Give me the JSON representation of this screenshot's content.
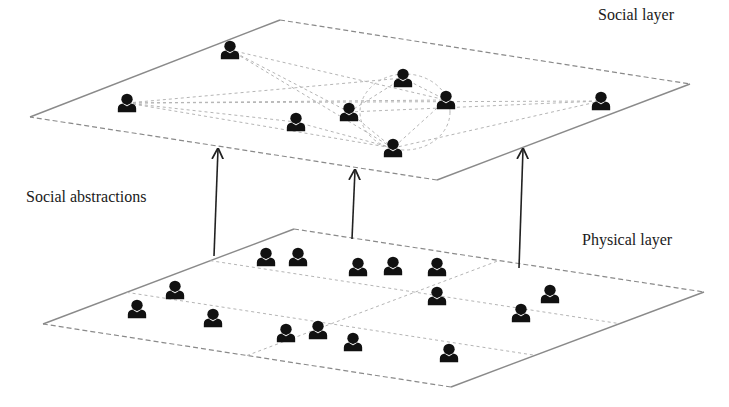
{
  "labels": {
    "social_layer": "Social layer",
    "physical_layer": "Physical layer",
    "social_abstractions": "Social abstractions"
  },
  "colors": {
    "plane_edge": "#8a8a8a",
    "dashed_link": "#b5b5b5",
    "person": "#111111",
    "arrow": "#222222"
  },
  "social_layer": {
    "plane": [
      [
        30,
        117
      ],
      [
        280,
        20
      ],
      [
        690,
        84
      ],
      [
        437,
        180
      ]
    ],
    "persons": [
      [
        230,
        50
      ],
      [
        127,
        103
      ],
      [
        296,
        122
      ],
      [
        349,
        112
      ],
      [
        403,
        78
      ],
      [
        446,
        100
      ],
      [
        393,
        148
      ],
      [
        601,
        101
      ]
    ],
    "links": [
      [
        0,
        5
      ],
      [
        0,
        6
      ],
      [
        0,
        3
      ],
      [
        1,
        4
      ],
      [
        1,
        5
      ],
      [
        1,
        7
      ],
      [
        1,
        2
      ],
      [
        1,
        6
      ],
      [
        2,
        6
      ],
      [
        3,
        6
      ],
      [
        3,
        4
      ],
      [
        4,
        5
      ],
      [
        5,
        6
      ],
      [
        6,
        7
      ],
      [
        3,
        7
      ]
    ]
  },
  "physical_layer": {
    "plane": [
      [
        43,
        324
      ],
      [
        294,
        229
      ],
      [
        704,
        292
      ],
      [
        451,
        387
      ]
    ],
    "persons": [
      [
        266,
        257
      ],
      [
        298,
        257
      ],
      [
        358,
        267
      ],
      [
        393,
        266
      ],
      [
        437,
        267
      ],
      [
        437,
        296
      ],
      [
        175,
        290
      ],
      [
        137,
        309
      ],
      [
        213,
        318
      ],
      [
        286,
        333
      ],
      [
        318,
        330
      ],
      [
        353,
        342
      ],
      [
        521,
        313
      ],
      [
        550,
        294
      ],
      [
        449,
        353
      ]
    ]
  },
  "arrows": [
    {
      "from": [
        214,
        256
      ],
      "to": [
        218,
        149
      ]
    },
    {
      "from": [
        352,
        239
      ],
      "to": [
        355,
        170
      ]
    },
    {
      "from": [
        519,
        268
      ],
      "to": [
        523,
        149
      ]
    }
  ]
}
